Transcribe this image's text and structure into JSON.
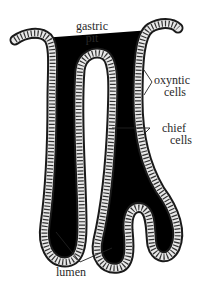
{
  "figure": {
    "colors": {
      "background": "#ffffff",
      "tube_outline": "#1a1a1a",
      "cell_fill": "#e8e8e8",
      "label_text": "#2a2a2a"
    }
  },
  "labels": {
    "gastric_pit": {
      "line1": "gastric",
      "line2": "pit"
    },
    "oxyntic_cells": {
      "line1": "oxyntic",
      "line2": "cells"
    },
    "chief_cells": {
      "line1": "chief",
      "line2": "cells"
    },
    "lumen": {
      "text": "lumen"
    }
  }
}
